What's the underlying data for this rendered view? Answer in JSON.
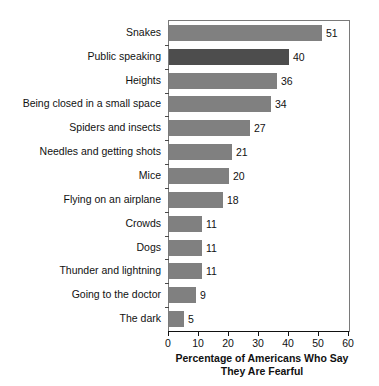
{
  "chart_data": {
    "type": "bar",
    "orientation": "horizontal",
    "title": "",
    "subtitle": "",
    "xlabel": "Percentage of Americans Who Say They Are Fearful",
    "xlabel_line1": "Percentage of Americans Who Say",
    "xlabel_line2": "They Are Fearful",
    "ylabel": "",
    "xlim": [
      0,
      60
    ],
    "xticks": [
      0,
      10,
      20,
      30,
      40,
      50,
      60
    ],
    "xticklabels": [
      "0",
      "10",
      "20",
      "30",
      "40",
      "50",
      "60"
    ],
    "grid": false,
    "legend": null,
    "categories": [
      "Snakes",
      "Public speaking",
      "Heights",
      "Being closed in a small space",
      "Spiders and insects",
      "Needles and getting shots",
      "Mice",
      "Flying on an airplane",
      "Crowds",
      "Dogs",
      "Thunder and lightning",
      "Going to the doctor",
      "The dark"
    ],
    "values": [
      51,
      40,
      36,
      34,
      27,
      21,
      20,
      18,
      11,
      11,
      11,
      9,
      5
    ],
    "value_labels": [
      "51",
      "40",
      "36",
      "34",
      "27",
      "21",
      "20",
      "18",
      "11",
      "11",
      "11",
      "9",
      "5"
    ],
    "highlighted_category": "Public speaking",
    "colors": {
      "bar": "#808080",
      "bar_highlight": "#4d4d4d",
      "axis": "#111111",
      "plot_border": "#7a7a7a",
      "background": "#ffffff",
      "text": "#111111"
    }
  }
}
